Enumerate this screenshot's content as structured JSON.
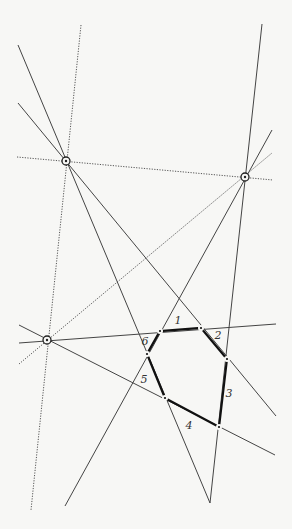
{
  "diagram": {
    "colors": {
      "background": "#f7f7f5",
      "line": "#444444",
      "thick": "#111111",
      "dotted": "#555555"
    },
    "points": [
      {
        "id": "P1",
        "x": 66,
        "y": 161
      },
      {
        "id": "P2",
        "x": 245,
        "y": 177
      },
      {
        "id": "P3",
        "x": 47,
        "y": 340
      }
    ],
    "dotted_lines": [
      {
        "x1": 81,
        "y1": 25,
        "x2": 31,
        "y2": 510
      },
      {
        "x1": 17,
        "y1": 157,
        "x2": 273,
        "y2": 180
      },
      {
        "x1": 19,
        "y1": 364,
        "x2": 272,
        "y2": 153
      }
    ],
    "solid_lines": [
      {
        "x1": 18,
        "y1": 45,
        "x2": 210,
        "y2": 503
      },
      {
        "x1": 18,
        "y1": 103,
        "x2": 276,
        "y2": 416
      },
      {
        "x1": 262,
        "y1": 24,
        "x2": 210,
        "y2": 503
      },
      {
        "x1": 272,
        "y1": 130,
        "x2": 65,
        "y2": 506
      },
      {
        "x1": 19,
        "y1": 343,
        "x2": 276,
        "y2": 324
      },
      {
        "x1": 19,
        "y1": 325,
        "x2": 275,
        "y2": 455
      }
    ],
    "hexagon": {
      "vertices": [
        {
          "x": 160,
          "y": 331
        },
        {
          "x": 201,
          "y": 328
        },
        {
          "x": 227,
          "y": 359
        },
        {
          "x": 219,
          "y": 427
        },
        {
          "x": 165,
          "y": 398
        },
        {
          "x": 147,
          "y": 354
        }
      ],
      "edge_labels": [
        {
          "text": "1",
          "x": 178,
          "y": 324
        },
        {
          "text": "2",
          "x": 218,
          "y": 339
        },
        {
          "text": "3",
          "x": 229,
          "y": 397
        },
        {
          "text": "4",
          "x": 189,
          "y": 429
        },
        {
          "text": "5",
          "x": 144,
          "y": 383
        },
        {
          "text": "6",
          "x": 145,
          "y": 345
        }
      ]
    }
  }
}
